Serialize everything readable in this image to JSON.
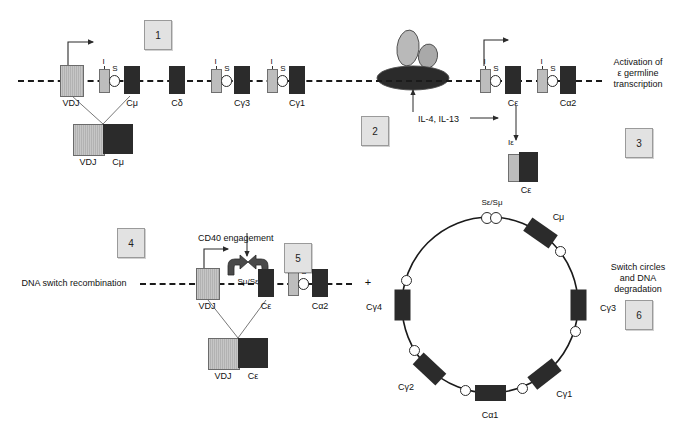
{
  "figure": {
    "type": "diagram"
  },
  "steps": [
    {
      "id": "step-1",
      "number": "1"
    },
    {
      "id": "step-2",
      "number": "2"
    },
    {
      "id": "step-3",
      "number": "3"
    },
    {
      "id": "step-4",
      "number": "4"
    },
    {
      "id": "step-5",
      "number": "5"
    },
    {
      "id": "step-6",
      "number": "6"
    }
  ],
  "annotations": {
    "cytokines": "IL-4, IL-13",
    "activation": "Activation of\nε germline\ntranscription",
    "activation_line1": "Activation of",
    "activation_line2": "ε germline",
    "activation_line3": "transcription",
    "cd40": "CD40 engagement",
    "dna_switch": "DNA switch recombination",
    "switch_circles_line1": "Switch circles",
    "switch_circles_line2": "and DNA",
    "switch_circles_line3": "degradation",
    "smu_se": "Sμ/Sε",
    "se_smu": "Sε/Sμ",
    "plus": "+"
  },
  "top_locus": {
    "segments": [
      {
        "name": "VDJ",
        "label": "VDJ",
        "kind": "vdj",
        "x": 60,
        "w": 22,
        "h": 30,
        "has_i": false,
        "has_s": false
      },
      {
        "name": "Imu",
        "label": "",
        "kind": "gray",
        "x": 99,
        "w": 9,
        "h": 22,
        "has_i": true,
        "has_s": true
      },
      {
        "name": "Cmu",
        "label": "Cμ",
        "kind": "dark",
        "x": 124,
        "w": 16,
        "h": 28,
        "has_i": false,
        "has_s": false
      },
      {
        "name": "Cdelta",
        "label": "Cδ",
        "kind": "dark",
        "x": 169,
        "w": 16,
        "h": 28,
        "has_i": false,
        "has_s": false
      },
      {
        "name": "Ig3",
        "label": "",
        "kind": "gray",
        "x": 211,
        "w": 9,
        "h": 22,
        "has_i": true,
        "has_s": true
      },
      {
        "name": "Cg3",
        "label": "Cγ3",
        "kind": "dark",
        "x": 234,
        "w": 16,
        "h": 28,
        "has_i": false,
        "has_s": false
      },
      {
        "name": "Ig1",
        "label": "",
        "kind": "gray",
        "x": 267,
        "w": 9,
        "h": 22,
        "has_i": true,
        "has_s": true
      },
      {
        "name": "Cg1",
        "label": "Cγ1",
        "kind": "dark",
        "x": 289,
        "w": 16,
        "h": 28,
        "has_i": false,
        "has_s": false
      }
    ],
    "i_label": "I",
    "s_label": "S"
  },
  "top_right_locus": {
    "segments": [
      {
        "name": "Iepsilon",
        "label": "",
        "kind": "gray",
        "x": 480,
        "w": 9,
        "h": 22,
        "has_i": true,
        "has_s": true
      },
      {
        "name": "Cepsilon",
        "label": "Cε",
        "kind": "dark",
        "x": 505,
        "w": 16,
        "h": 28,
        "has_i": false,
        "has_s": false
      },
      {
        "name": "Ialpha2",
        "label": "",
        "kind": "gray",
        "x": 537,
        "w": 9,
        "h": 22,
        "has_i": true,
        "has_s": true
      },
      {
        "name": "Calpha2",
        "label": "Cα2",
        "kind": "dark",
        "x": 560,
        "w": 16,
        "h": 28,
        "has_i": false,
        "has_s": false
      }
    ]
  },
  "vdj_cmu_transcript": {
    "left_label": "VDJ",
    "right_label": "Cμ"
  },
  "ie_ce_transcript": {
    "top_label": "Iε",
    "bottom_label": "Cε"
  },
  "bottom_locus": {
    "segments": [
      {
        "name": "VDJ",
        "label": "VDJ",
        "kind": "vdj",
        "x": 196,
        "w": 22,
        "h": 30,
        "has_i": false,
        "has_s": false
      },
      {
        "name": "Cepsilon",
        "label": "Cε",
        "kind": "dark",
        "x": 258,
        "w": 16,
        "h": 28,
        "has_i": false,
        "has_s": false
      },
      {
        "name": "Ialpha2",
        "label": "",
        "kind": "gray",
        "x": 288,
        "w": 9,
        "h": 22,
        "has_i": true,
        "has_s": true
      },
      {
        "name": "Calpha2",
        "label": "Cα2",
        "kind": "dark",
        "x": 312,
        "w": 16,
        "h": 28,
        "has_i": false,
        "has_s": false
      }
    ]
  },
  "vdj_ce_transcript": {
    "left_label": "VDJ",
    "right_label": "Cε"
  },
  "switch_circle": {
    "center_x": 490,
    "center_y": 305,
    "radius": 88,
    "top_label": "Sε/Sμ",
    "blocks": [
      {
        "name": "Cmu",
        "label": "Cμ",
        "angle": -55,
        "label_dx": 18,
        "label_dy": -16
      },
      {
        "name": "Cg3",
        "label": "Cγ3",
        "angle": 0,
        "label_dx": 30,
        "label_dy": 3
      },
      {
        "name": "Cg1",
        "label": "Cγ1",
        "angle": 52,
        "label_dx": 20,
        "label_dy": 20
      },
      {
        "name": "Ca1",
        "label": "Cα1",
        "angle": 90,
        "label_dx": 0,
        "label_dy": 22
      },
      {
        "name": "Cg2",
        "label": "Cγ2",
        "angle": 133,
        "label_dx": -24,
        "label_dy": 18
      },
      {
        "name": "Cg4",
        "label": "Cγ4",
        "angle": 180,
        "label_dx": -28,
        "label_dy": 2
      }
    ],
    "junction_label": "Sε/Sμ"
  },
  "colors": {
    "dark_segment": "#2b2b2b",
    "gray_segment": "#bdbdbd",
    "vdj_segment": "#c0c0c0",
    "step_box": "#e2e2e2",
    "line": "#1a1a1a"
  }
}
